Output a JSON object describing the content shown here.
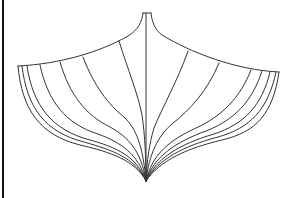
{
  "figure": {
    "title": "Boat hull body plan",
    "colors": {
      "background": "#ffffff",
      "line": "#333333",
      "border": "#111111"
    },
    "stations": {
      "left_count": 7,
      "right_count": 7
    }
  }
}
